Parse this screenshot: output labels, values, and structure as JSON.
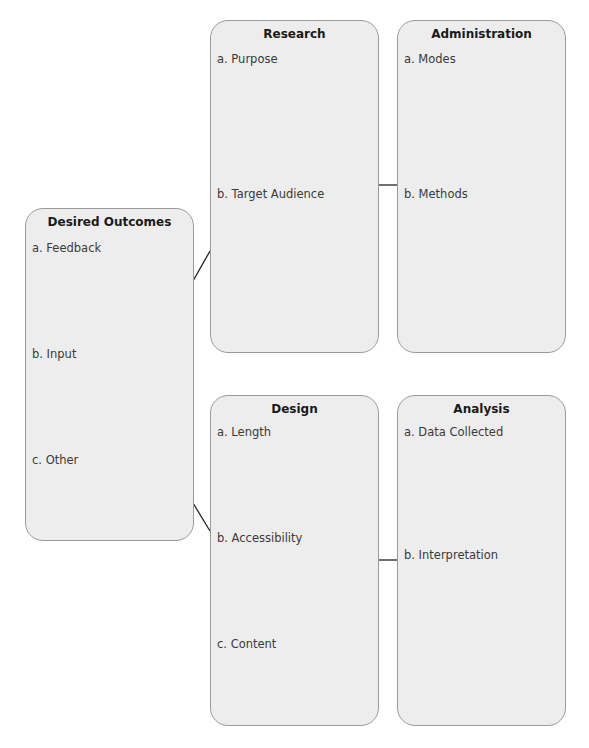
{
  "boxes": {
    "desired_outcomes": {
      "title": "Desired Outcomes",
      "items": [
        "a.  Feedback",
        "b.  Input",
        "c.  Other"
      ]
    },
    "research": {
      "title": "Research",
      "items": [
        "a.  Purpose",
        "b.  Target Audience"
      ]
    },
    "administration": {
      "title": "Administration",
      "items": [
        "a.  Modes",
        "b.  Methods"
      ]
    },
    "design": {
      "title": "Design",
      "items": [
        "a.  Length",
        "b.  Accessibility",
        "c.  Content"
      ]
    },
    "analysis": {
      "title": "Analysis",
      "items": [
        "a.  Data Collected",
        "b.  Interpretation"
      ]
    }
  },
  "connections": [
    {
      "from": "Desired Outcomes",
      "to": "Research"
    },
    {
      "from": "Research",
      "to": "Administration"
    },
    {
      "from": "Desired Outcomes",
      "to": "Design"
    },
    {
      "from": "Design",
      "to": "Analysis"
    }
  ],
  "colors": {
    "box_fill": "#ededed",
    "box_border": "#9a9a9a",
    "connector": "#222222"
  }
}
